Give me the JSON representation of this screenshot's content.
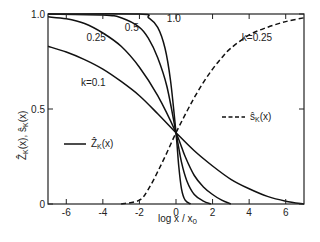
{
  "chart_data": {
    "type": "line",
    "title": "",
    "xlabel": "log x / x0",
    "ylabel": "Ẑ_K(x), ŝ_K(x)",
    "xlim": [
      -7,
      7
    ],
    "ylim": [
      0,
      1.0
    ],
    "grid": false,
    "x_ticks": [
      -6,
      -4,
      -2,
      0,
      2,
      4,
      6
    ],
    "x_tick_labels": [
      "-6",
      "-4",
      "-2",
      "0",
      "2",
      "4",
      "6"
    ],
    "y_ticks": [
      0,
      0.5,
      1.0
    ],
    "y_tick_labels": [
      "0",
      "0.5",
      "1.0"
    ],
    "legend": [
      {
        "label": "Ẑ_K(x)",
        "style": "solid"
      },
      {
        "label": "ŝ_K(x)",
        "style": "dashed"
      }
    ],
    "series": [
      {
        "name": "Ẑ_K(x), k=0.1",
        "label": "k=0.1",
        "style": "solid",
        "x": [
          -7,
          -6,
          -5,
          -4,
          -3,
          -2,
          -1,
          0,
          1,
          2,
          3,
          4,
          5,
          6,
          7
        ],
        "y": [
          0.83,
          0.8,
          0.76,
          0.71,
          0.645,
          0.57,
          0.475,
          0.375,
          0.28,
          0.2,
          0.13,
          0.08,
          0.04,
          0.015,
          0.0
        ]
      },
      {
        "name": "Ẑ_K(x), k=0.25",
        "label": "0.25",
        "style": "solid",
        "x": [
          -7,
          -6,
          -5,
          -4,
          -3,
          -2,
          -1,
          0,
          0.5,
          1,
          1.5,
          2,
          2.5,
          3
        ],
        "y": [
          0.985,
          0.975,
          0.95,
          0.9,
          0.83,
          0.72,
          0.57,
          0.375,
          0.25,
          0.15,
          0.09,
          0.05,
          0.02,
          0.0
        ]
      },
      {
        "name": "Ẑ_K(x), k=0.5",
        "label": "0.5",
        "style": "solid",
        "x": [
          -7,
          -4,
          -3,
          -2,
          -1.5,
          -1,
          -0.5,
          0,
          0.3,
          0.6,
          1,
          1.5,
          1.9
        ],
        "y": [
          1.0,
          0.995,
          0.98,
          0.93,
          0.87,
          0.77,
          0.62,
          0.375,
          0.22,
          0.12,
          0.05,
          0.015,
          0.0
        ]
      },
      {
        "name": "Ẑ_K(x), k=1.0",
        "label": "1.0",
        "style": "solid",
        "x": [
          -7,
          -2,
          -1.5,
          -1,
          -0.6,
          -0.3,
          0,
          0.15,
          0.3,
          0.5,
          0.8
        ],
        "y": [
          1.0,
          1.0,
          0.98,
          0.93,
          0.82,
          0.65,
          0.375,
          0.2,
          0.08,
          0.02,
          0.0
        ]
      },
      {
        "name": "ŝ_K(x), k=0.25",
        "label": "k=0.25",
        "style": "dashed",
        "x": [
          -3,
          -2,
          -1.5,
          -1,
          -0.5,
          0,
          0.5,
          1,
          1.5,
          2,
          2.5,
          3,
          4,
          5,
          6,
          7
        ],
        "y": [
          0.0,
          0.02,
          0.08,
          0.17,
          0.27,
          0.375,
          0.47,
          0.56,
          0.64,
          0.71,
          0.77,
          0.82,
          0.89,
          0.93,
          0.96,
          0.98
        ]
      }
    ],
    "annotations": [
      {
        "text": "k=0.1",
        "x": -5.2,
        "y": 0.62
      },
      {
        "text": "0.25",
        "x": -4.9,
        "y": 0.86
      },
      {
        "text": "0.5",
        "x": -2.8,
        "y": 0.91
      },
      {
        "text": "1.0",
        "x": -0.5,
        "y": 0.96
      },
      {
        "text": "k=0.25",
        "x": 3.6,
        "y": 0.86
      }
    ]
  },
  "labels": {
    "xlabel": "log x / x",
    "xlabel_sub": "0",
    "ylabel_main": "Ẑ",
    "ylabel_rest": "(x), ŝ",
    "ylabel_sub": "K",
    "ylabel_end": "(x)",
    "legend_z_main": "Ẑ",
    "legend_z_sub": "K",
    "legend_z_end": "(x)",
    "legend_s_main": "ŝ",
    "legend_s_sub": "K",
    "legend_s_end": "(x)"
  }
}
